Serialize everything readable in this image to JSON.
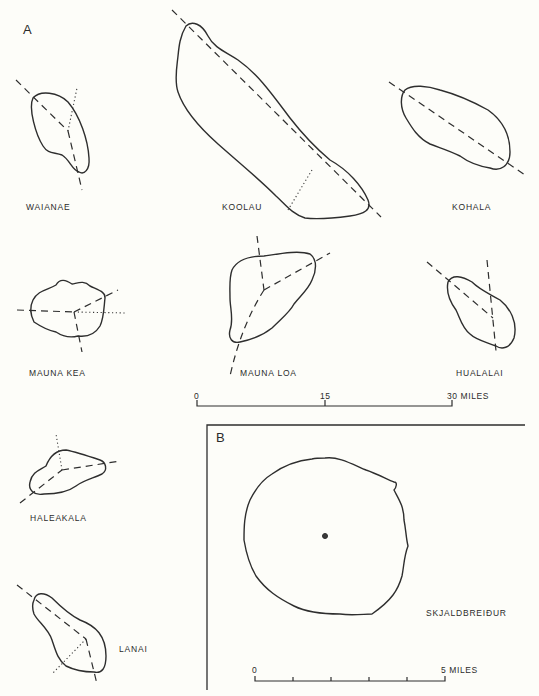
{
  "figure": {
    "panel_a": {
      "label": "A",
      "volcanoes": [
        {
          "name": "WAIANAE"
        },
        {
          "name": "KOOLAU"
        },
        {
          "name": "KOHALA"
        },
        {
          "name": "MAUNA KEA"
        },
        {
          "name": "MAUNA LOA"
        },
        {
          "name": "HUALALAI"
        },
        {
          "name": "HALEAKALA"
        },
        {
          "name": "LANAI"
        }
      ],
      "scale_bar": {
        "ticks": [
          "0",
          "15",
          "30 MILES"
        ],
        "max_miles": 30
      }
    },
    "panel_b": {
      "label": "B",
      "volcano": {
        "name": "SKJALDBREIĐUR"
      },
      "scale_bar": {
        "ticks": [
          "0",
          "5 MILES"
        ],
        "max_miles": 5,
        "divisions": 5
      }
    },
    "legend": {
      "dashed_line": "rift zone",
      "dotted_line": "inferred rift"
    }
  }
}
